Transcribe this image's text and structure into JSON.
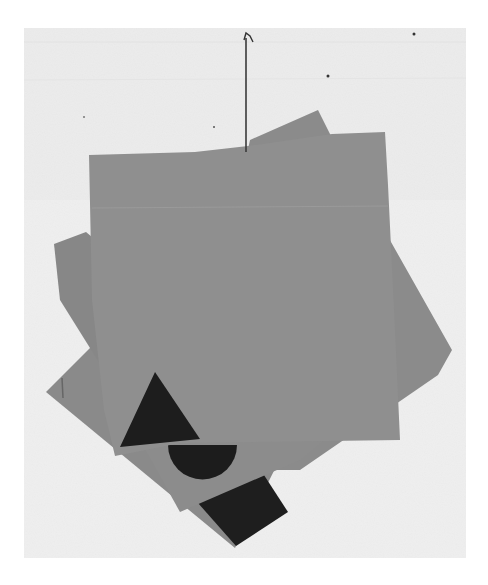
{
  "image": {
    "description": "Four stacked gray cardboard sheets hanging from a nail against a white textured wall, with black geometric shapes (triangle, semicircle, rectangle) on the lower corners",
    "colors": {
      "background": "#f1f1f1",
      "wall_frame": "#ebebeb",
      "sheet_front": "#8f8f8f",
      "sheet_back": "#858585",
      "sheet_mid": "#8a8a8a",
      "shape_dark": "#1e1e1e",
      "nail": "#3a3a3a"
    },
    "shapes": [
      "triangle",
      "semicircle",
      "rectangle"
    ]
  }
}
